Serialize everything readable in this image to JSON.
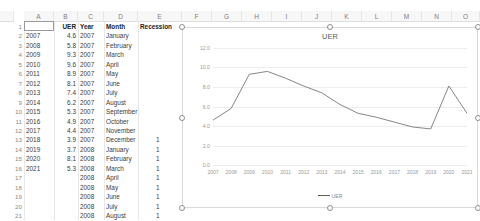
{
  "grid": {
    "column_headers": [
      "A",
      "B",
      "C",
      "D",
      "E",
      "F",
      "G",
      "H",
      "I",
      "J",
      "K",
      "L",
      "M",
      "N",
      "O"
    ],
    "row_numbers": [
      "1",
      "2",
      "3",
      "4",
      "5",
      "6",
      "7",
      "8",
      "9",
      "10",
      "11",
      "12",
      "13",
      "14",
      "15",
      "16",
      "17",
      "18",
      "19",
      "20",
      "21"
    ],
    "headers": {
      "a": "",
      "b": "UER",
      "c": "Year",
      "d": "Month",
      "e": "Recession"
    },
    "rows": [
      {
        "row": "2",
        "a": "2007",
        "b": "4.6",
        "c": "2007",
        "d": "January",
        "e": ""
      },
      {
        "row": "3",
        "a": "2008",
        "b": "5.8",
        "c": "2007",
        "d": "February",
        "e": ""
      },
      {
        "row": "4",
        "a": "2009",
        "b": "9.3",
        "c": "2007",
        "d": "March",
        "e": ""
      },
      {
        "row": "5",
        "a": "2010",
        "b": "9.6",
        "c": "2007",
        "d": "April",
        "e": ""
      },
      {
        "row": "6",
        "a": "2011",
        "b": "8.9",
        "c": "2007",
        "d": "May",
        "e": ""
      },
      {
        "row": "7",
        "a": "2012",
        "b": "8.1",
        "c": "2007",
        "d": "June",
        "e": ""
      },
      {
        "row": "8",
        "a": "2013",
        "b": "7.4",
        "c": "2007",
        "d": "July",
        "e": ""
      },
      {
        "row": "9",
        "a": "2014",
        "b": "6.2",
        "c": "2007",
        "d": "August",
        "e": ""
      },
      {
        "row": "10",
        "a": "2015",
        "b": "5.3",
        "c": "2007",
        "d": "September",
        "e": ""
      },
      {
        "row": "11",
        "a": "2016",
        "b": "4.9",
        "c": "2007",
        "d": "October",
        "e": ""
      },
      {
        "row": "12",
        "a": "2017",
        "b": "4.4",
        "c": "2007",
        "d": "November",
        "e": ""
      },
      {
        "row": "13",
        "a": "2018",
        "b": "3.9",
        "c": "2007",
        "d": "December",
        "e": "1"
      },
      {
        "row": "14",
        "a": "2019",
        "b": "3.7",
        "c": "2008",
        "d": "January",
        "e": "1"
      },
      {
        "row": "15",
        "a": "2020",
        "b": "8.1",
        "c": "2008",
        "d": "February",
        "e": "1"
      },
      {
        "row": "16",
        "a": "2021",
        "b": "5.3",
        "c": "2008",
        "d": "March",
        "e": "1"
      },
      {
        "row": "17",
        "a": "",
        "b": "",
        "c": "2008",
        "d": "April",
        "e": "1"
      },
      {
        "row": "18",
        "a": "",
        "b": "",
        "c": "2008",
        "d": "May",
        "e": "1"
      },
      {
        "row": "19",
        "a": "",
        "b": "",
        "c": "2008",
        "d": "June",
        "e": "1"
      },
      {
        "row": "20",
        "a": "",
        "b": "",
        "c": "2008",
        "d": "July",
        "e": "1"
      },
      {
        "row": "21",
        "a": "",
        "b": "",
        "c": "2008",
        "d": "August",
        "e": "1"
      }
    ],
    "selected_cell": "A1"
  },
  "chart_data": {
    "type": "line",
    "title": "UER",
    "xlabel": "",
    "ylabel": "",
    "categories": [
      "2007",
      "2008",
      "2009",
      "2010",
      "2011",
      "2012",
      "2013",
      "2014",
      "2015",
      "2016",
      "2017",
      "2018",
      "2019",
      "2020",
      "2021"
    ],
    "series": [
      {
        "name": "UER",
        "values": [
          4.6,
          5.8,
          9.3,
          9.6,
          8.9,
          8.1,
          7.4,
          6.2,
          5.3,
          4.9,
          4.4,
          3.9,
          3.7,
          8.1,
          5.3
        ]
      }
    ],
    "ylim": [
      0,
      12
    ],
    "yticks": [
      "0.0",
      "2.0",
      "4.0",
      "6.0",
      "8.0",
      "10.0",
      "12.0"
    ],
    "grid": true,
    "legend": [
      "UER"
    ],
    "legend_position": "bottom",
    "line_color": "#5d5d5d",
    "selected": true
  }
}
